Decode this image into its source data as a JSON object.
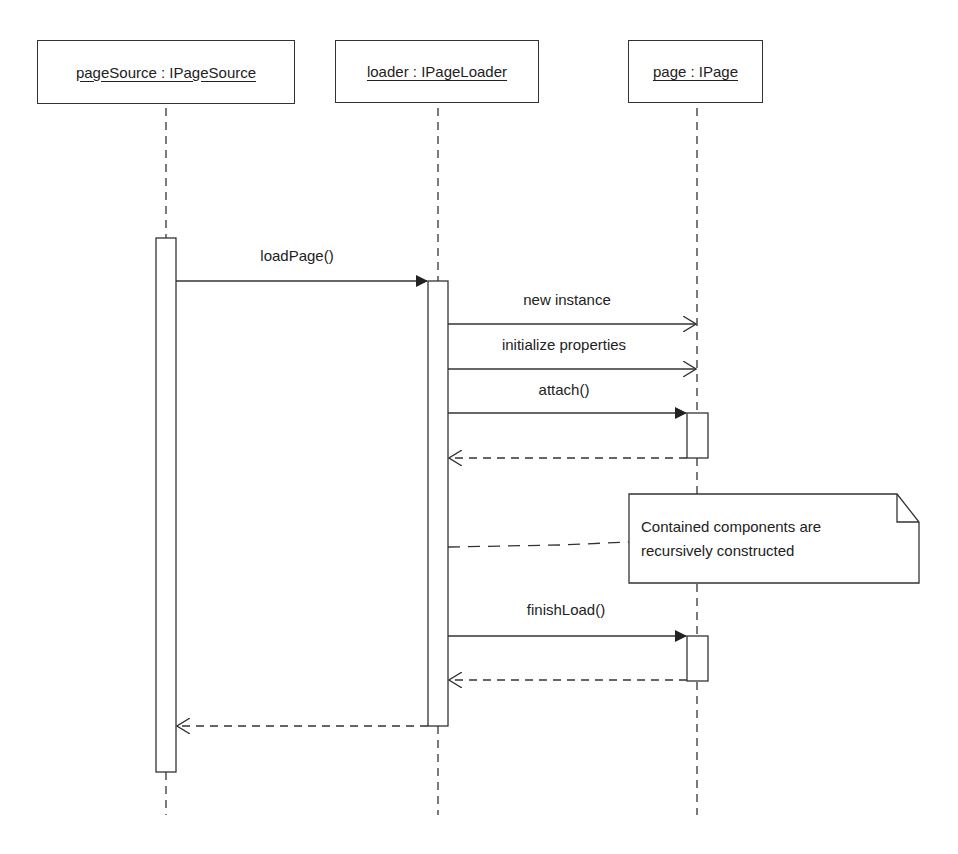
{
  "participants": [
    {
      "label": "pageSource : IPageSource"
    },
    {
      "label": "loader : IPageLoader"
    },
    {
      "label": "page : IPage"
    }
  ],
  "messages": [
    {
      "label": "loadPage()",
      "from": "pageSource",
      "to": "loader",
      "type": "sync"
    },
    {
      "label": "new instance",
      "from": "loader",
      "to": "page",
      "type": "create"
    },
    {
      "label": "initialize properties",
      "from": "loader",
      "to": "page",
      "type": "async"
    },
    {
      "label": "attach()",
      "from": "loader",
      "to": "page",
      "type": "sync"
    },
    {
      "label": "",
      "from": "page",
      "to": "loader",
      "type": "return"
    },
    {
      "label": "finishLoad()",
      "from": "loader",
      "to": "page",
      "type": "sync"
    },
    {
      "label": "",
      "from": "page",
      "to": "loader",
      "type": "return"
    },
    {
      "label": "",
      "from": "loader",
      "to": "pageSource",
      "type": "return"
    }
  ],
  "note": {
    "line1": "Contained components are",
    "line2": "recursively constructed"
  },
  "colors": {
    "stroke": "#333333",
    "background": "#ffffff"
  }
}
